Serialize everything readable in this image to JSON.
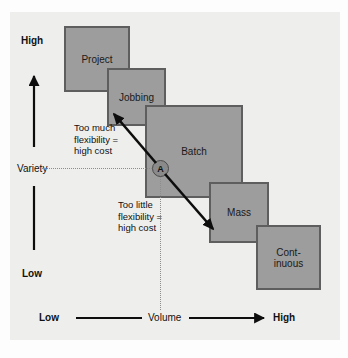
{
  "diagram": {
    "background_color": "#eeeeec",
    "box_fill": "#9d9d9d",
    "box_stroke": "#5e5e5e"
  },
  "y_axis": {
    "label": "Variety",
    "high_label": "High",
    "low_label": "Low"
  },
  "x_axis": {
    "label": "Volume",
    "low_label": "Low",
    "high_label": "High"
  },
  "process_boxes": [
    {
      "id": "project",
      "label": "Project"
    },
    {
      "id": "jobbing",
      "label": "Jobbing"
    },
    {
      "id": "batch",
      "label": "Batch"
    },
    {
      "id": "mass",
      "label": "Mass"
    },
    {
      "id": "continuous",
      "label_line1": "Cont-",
      "label_line2": "inuous"
    }
  ],
  "marker": {
    "label": "A"
  },
  "annotations": [
    {
      "id": "too-much",
      "line1": "Too much",
      "line2": "flexibility =",
      "line3": "high cost"
    },
    {
      "id": "too-little",
      "line1": "Too little",
      "line2": "flexibility =",
      "line3": "high cost"
    }
  ]
}
